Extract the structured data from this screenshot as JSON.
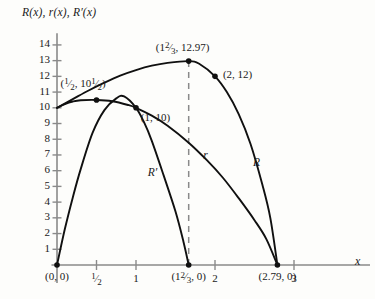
{
  "chart_data": {
    "type": "line",
    "title": "",
    "ylabel": "R(x), r(x), R'(x)",
    "xlabel": "x",
    "xlim": [
      0,
      3.25
    ],
    "ylim": [
      0,
      14.6
    ],
    "grid": false,
    "legend": "inline-curve-labels",
    "xticks": [
      {
        "value": 0.5,
        "label": "1/2"
      },
      {
        "value": 1,
        "label": "1"
      },
      {
        "value": 2,
        "label": "2"
      },
      {
        "value": 3,
        "label": "3"
      }
    ],
    "yticks": [
      {
        "value": 1,
        "label": "1"
      },
      {
        "value": 2,
        "label": "2"
      },
      {
        "value": 3,
        "label": "3"
      },
      {
        "value": 4,
        "label": "4"
      },
      {
        "value": 5,
        "label": "5"
      },
      {
        "value": 6,
        "label": "6"
      },
      {
        "value": 7,
        "label": "7"
      },
      {
        "value": 8,
        "label": "8"
      },
      {
        "value": 9,
        "label": "9"
      },
      {
        "value": 10,
        "label": "10"
      },
      {
        "value": 11,
        "label": "11"
      },
      {
        "value": 12,
        "label": "12"
      },
      {
        "value": 13,
        "label": "13"
      },
      {
        "value": 14,
        "label": "14"
      }
    ],
    "series": [
      {
        "name": "r",
        "label": "r",
        "label_pos": [
          1.85,
          6.9
        ],
        "points": [
          [
            0,
            10.0
          ],
          [
            0.1,
            10.24
          ],
          [
            0.2,
            10.4
          ],
          [
            0.3,
            10.48
          ],
          [
            0.5,
            10.5
          ],
          [
            0.7,
            10.42
          ],
          [
            0.9,
            10.18
          ],
          [
            1.0,
            10.0
          ],
          [
            1.2,
            9.5
          ],
          [
            1.4,
            8.86
          ],
          [
            1.667,
            7.78
          ],
          [
            1.9,
            6.65
          ],
          [
            2.1,
            5.55
          ],
          [
            2.3,
            4.25
          ],
          [
            2.5,
            2.85
          ],
          [
            2.65,
            1.65
          ],
          [
            2.79,
            0
          ]
        ]
      },
      {
        "name": "R",
        "label": "R",
        "label_pos": [
          2.48,
          6.45
        ],
        "points": [
          [
            0,
            10.0
          ],
          [
            0.2,
            10.55
          ],
          [
            0.4,
            11.1
          ],
          [
            0.6,
            11.6
          ],
          [
            0.8,
            12.05
          ],
          [
            1.0,
            12.4
          ],
          [
            1.2,
            12.68
          ],
          [
            1.4,
            12.86
          ],
          [
            1.667,
            12.97
          ],
          [
            1.8,
            12.8
          ],
          [
            2.0,
            12.0
          ],
          [
            2.15,
            11.0
          ],
          [
            2.3,
            9.6
          ],
          [
            2.45,
            7.7
          ],
          [
            2.6,
            5.1
          ],
          [
            2.7,
            3.0
          ],
          [
            2.79,
            0
          ]
        ]
      },
      {
        "name": "R'",
        "label": "R′",
        "label_pos": [
          1.15,
          5.8
        ],
        "points": [
          [
            0,
            0
          ],
          [
            0.1,
            2.3
          ],
          [
            0.2,
            4.3
          ],
          [
            0.3,
            6.1
          ],
          [
            0.45,
            8.4
          ],
          [
            0.6,
            9.85
          ],
          [
            0.75,
            10.6
          ],
          [
            0.85,
            10.72
          ],
          [
            1.0,
            10.0
          ],
          [
            1.1,
            9.1
          ],
          [
            1.2,
            7.9
          ],
          [
            1.35,
            5.7
          ],
          [
            1.5,
            3.4
          ],
          [
            1.6,
            1.5
          ],
          [
            1.667,
            0
          ]
        ]
      }
    ],
    "markers": [
      {
        "x": 0.5,
        "y": 10.5,
        "label": "(1/2, 10 1/2)",
        "label_pos": [
          0.33,
          11.45
        ],
        "anchor": "center"
      },
      {
        "x": 1.0,
        "y": 10.0,
        "label": "(1, 10)",
        "label_pos": [
          1.06,
          9.3
        ],
        "anchor": "left"
      },
      {
        "x": 1.667,
        "y": 12.97,
        "label": "(1 2/3, 12.97)",
        "label_pos": [
          1.25,
          13.75
        ],
        "anchor": "left"
      },
      {
        "x": 2.0,
        "y": 12.0,
        "label": "(2, 12)",
        "label_pos": [
          2.1,
          12.05
        ],
        "anchor": "left"
      },
      {
        "x": 0,
        "y": 0,
        "label": "(0, 0)",
        "label_pos": [
          0.0,
          -0.85
        ],
        "anchor": "center"
      },
      {
        "x": 1.667,
        "y": 0,
        "label": "(1 2/3, 0)",
        "label_pos": [
          1.667,
          -0.85
        ],
        "anchor": "center"
      },
      {
        "x": 2.79,
        "y": 0,
        "label": "(2.79, 0)",
        "label_pos": [
          2.79,
          -0.85
        ],
        "anchor": "center"
      }
    ],
    "annotations": [
      {
        "type": "dashed-vline",
        "x": 1.667,
        "y0": 0,
        "y1": 12.97
      }
    ],
    "colors": {
      "curve": "#101010",
      "axis": "#8a8a8a",
      "dashed": "#8a8a8a",
      "background": "#fdfdfb"
    }
  },
  "labels": {
    "y_axis_title_parts": [
      "R(x), ",
      "r(x), ",
      "R′(x)"
    ],
    "y_axis_title": "R(x), r(x), R′(x)",
    "x_axis_title": "x",
    "tick_half": "1/2",
    "tick_1": "1",
    "tick_2": "2",
    "tick_3": "3",
    "curve_r": "r",
    "curve_R": "R",
    "curve_Rprime": "R′",
    "pt_origin": "(0, 0)",
    "pt_half": "(1/2, 10 1/2)",
    "pt_one": "(1, 10)",
    "pt_peak": "(1 2/3, 12.97)",
    "pt_two": "(2, 12)",
    "pt_root_rprime": "(1 2/3, 0)",
    "pt_root_R": "(2.79, 0)"
  }
}
